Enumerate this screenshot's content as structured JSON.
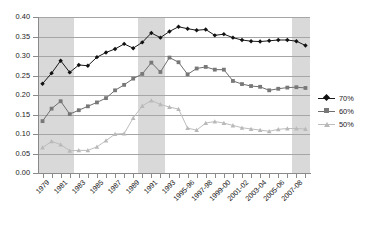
{
  "chart_data": {
    "type": "line",
    "title": "",
    "subtitle": "",
    "xlabel": "",
    "ylabel": "",
    "ylim": [
      0.0,
      0.4
    ],
    "ytick_values": [
      0.0,
      0.05,
      0.1,
      0.15,
      0.2,
      0.25,
      0.3,
      0.35,
      0.4
    ],
    "ytick_labels": [
      "0.00",
      "0.05",
      "0.10",
      "0.15",
      "0.20",
      "0.25",
      "0.30",
      "0.35",
      "0.40"
    ],
    "grid": "horizontal",
    "legend_position": "right",
    "x": [
      "1979",
      "1980",
      "1981",
      "1982",
      "1983",
      "1984",
      "1985",
      "1986",
      "1987",
      "1988",
      "1989",
      "1990",
      "1991",
      "1992",
      "1993",
      "1994",
      "1995-96",
      "1996-97",
      "1997-98",
      "1998-99",
      "1999-00",
      "2000-01",
      "2001-02",
      "2002-03",
      "2003-04",
      "2004-05",
      "2005-06",
      "2006-07",
      "2007-08",
      "2008-09"
    ],
    "xtick_labels_shown": [
      "1979",
      "",
      "1981",
      "",
      "1983",
      "",
      "1985",
      "",
      "1987",
      "",
      "1989",
      "",
      "1991",
      "",
      "1993",
      "",
      "1995-96",
      "",
      "1997-98",
      "",
      "1999-00",
      "",
      "2001-02",
      "",
      "2003-04",
      "",
      "2005-06",
      "",
      "2007-08",
      ""
    ],
    "series": [
      {
        "name": "70%",
        "color": "#1a1a1a",
        "marker": "diamond",
        "values": [
          0.229,
          0.256,
          0.288,
          0.258,
          0.277,
          0.275,
          0.297,
          0.309,
          0.318,
          0.331,
          0.32,
          0.335,
          0.359,
          0.347,
          0.363,
          0.375,
          0.37,
          0.366,
          0.368,
          0.353,
          0.356,
          0.347,
          0.341,
          0.338,
          0.337,
          0.339,
          0.341,
          0.341,
          0.338,
          0.327
        ]
      },
      {
        "name": "60%",
        "color": "#787878",
        "marker": "square",
        "values": [
          0.133,
          0.165,
          0.184,
          0.151,
          0.161,
          0.171,
          0.181,
          0.192,
          0.212,
          0.226,
          0.242,
          0.254,
          0.283,
          0.259,
          0.296,
          0.284,
          0.253,
          0.268,
          0.272,
          0.265,
          0.265,
          0.236,
          0.228,
          0.223,
          0.221,
          0.212,
          0.216,
          0.219,
          0.22,
          0.218
        ]
      },
      {
        "name": "50%",
        "color": "#b9b9b9",
        "marker": "triangle",
        "values": [
          0.065,
          0.081,
          0.073,
          0.057,
          0.058,
          0.058,
          0.067,
          0.083,
          0.1,
          0.101,
          0.141,
          0.172,
          0.186,
          0.176,
          0.169,
          0.164,
          0.115,
          0.11,
          0.128,
          0.132,
          0.128,
          0.122,
          0.116,
          0.113,
          0.11,
          0.107,
          0.112,
          0.114,
          0.114,
          0.113
        ]
      }
    ],
    "shaded_bands": [
      {
        "label": "recession-band-1",
        "x_start": "1979",
        "x_end": "1982",
        "color": "#d9d9d9"
      },
      {
        "label": "recession-band-2",
        "x_start": "1990",
        "x_end": "1992",
        "color": "#d9d9d9"
      },
      {
        "label": "recession-band-3",
        "x_start": "2007-08",
        "x_end": "2008-09",
        "color": "#d9d9d9"
      }
    ]
  },
  "legend": {
    "items": [
      {
        "label": "70%"
      },
      {
        "label": "60%"
      },
      {
        "label": "50%"
      }
    ]
  }
}
